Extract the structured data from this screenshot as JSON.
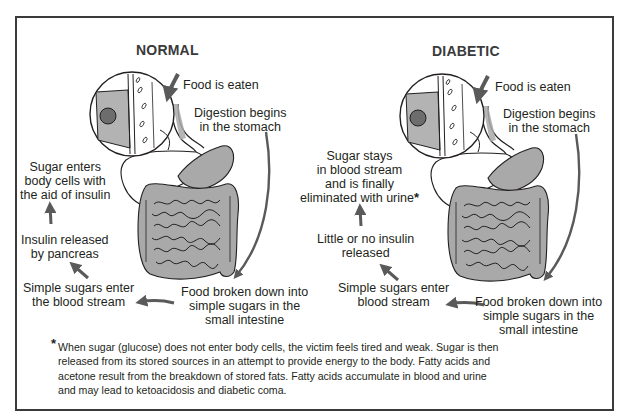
{
  "panels": [
    {
      "title": "NORMAL",
      "steps": {
        "food_eaten": "Food is eaten",
        "digestion": [
          "Digestion begins",
          "in the stomach"
        ],
        "broken_down": [
          "Food broken down into",
          "simple sugars in the",
          "small intestine"
        ],
        "enter_blood": [
          "Simple sugars enter",
          "the blood stream"
        ],
        "insulin": [
          "Insulin released",
          "by pancreas"
        ],
        "outcome": [
          "Sugar enters",
          "body cells with",
          "the aid of insulin"
        ]
      }
    },
    {
      "title": "DIABETIC",
      "steps": {
        "food_eaten": "Food is eaten",
        "digestion": [
          "Digestion begins",
          "in the stomach"
        ],
        "broken_down": [
          "Food broken down into",
          "simple sugars in the",
          "small intestine"
        ],
        "enter_blood": [
          "Simple sugars enter",
          "blood stream"
        ],
        "insulin": [
          "Little or no insulin",
          "released"
        ],
        "outcome": [
          "Sugar stays",
          "in blood stream",
          "and is finally",
          "eliminated with urine"
        ],
        "outcome_marker": "*"
      }
    }
  ],
  "footnote": {
    "marker": "*",
    "lines": [
      "When sugar (glucose) does not enter body cells, the victim feels tired and weak. Sugar is then",
      "released from its stored sources in an attempt to provide energy to the body. Fatty acids and",
      "acetone result from the breakdown of stored fats. Fatty acids accumulate in blood and urine",
      "and may lead to ketoacidosis and diabetic coma."
    ]
  },
  "colors": {
    "ink": "#231f20",
    "arrow": "#5a5a5a",
    "organ_fill": "#a9a9a9",
    "cell_fill": "#b3b3b3"
  }
}
